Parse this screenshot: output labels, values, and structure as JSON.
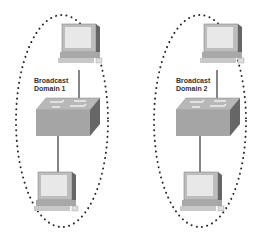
{
  "domains": [
    {
      "title_line1": "Broadcast",
      "title_line2": "Domain 1"
    },
    {
      "title_line1": "Broadcast",
      "title_line2": "Domain 2"
    }
  ],
  "colors": {
    "dots": "#2a2a2a",
    "monitor": "#bdbdbd",
    "screen": "#e6e6e6",
    "switch_top": "#b5b5b5",
    "switch_front": "#a8a8a8",
    "switch_side": "#6a6a6a",
    "cable": "#333333"
  }
}
